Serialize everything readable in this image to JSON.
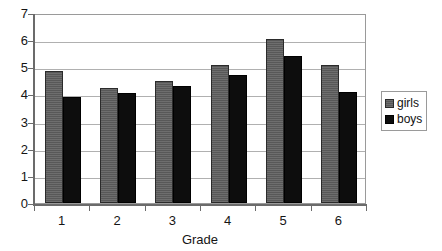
{
  "chart_data": {
    "type": "bar",
    "title": "",
    "subtitle": "",
    "xlabel": "Grade",
    "ylabel": "",
    "categories": [
      "1",
      "2",
      "3",
      "4",
      "5",
      "6"
    ],
    "series": [
      {
        "name": "girls",
        "color": "#585858",
        "values": [
          4.85,
          4.25,
          4.5,
          5.1,
          6.05,
          5.1
        ]
      },
      {
        "name": "boys",
        "color": "#0d0d0d",
        "values": [
          3.9,
          4.05,
          4.3,
          4.7,
          5.4,
          4.1
        ]
      }
    ],
    "ylim": [
      0,
      7
    ],
    "ytick_step": 1,
    "yticks": [
      "0",
      "1",
      "2",
      "3",
      "4",
      "5",
      "6",
      "7"
    ],
    "grid": true,
    "grid_axis": "y",
    "legend_position": "right"
  },
  "legend": {
    "items": [
      {
        "label": "girls",
        "swatch": "gray-square-swatch"
      },
      {
        "label": "boys",
        "swatch": "black-square-swatch"
      }
    ]
  },
  "axes": {
    "x_title": "Grade"
  },
  "caption": {
    "cropped_text": ""
  }
}
